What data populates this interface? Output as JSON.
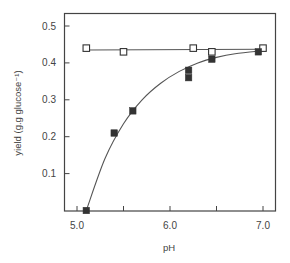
{
  "chart_data": {
    "type": "scatter",
    "title": "",
    "xlabel": "pH",
    "ylabel": "yield (g.g glucose⁻¹)",
    "xlim": [
      4.86,
      7.13
    ],
    "ylim": [
      0.0,
      0.535
    ],
    "x_ticks": [
      5.0,
      5.5,
      6.0,
      6.5,
      7.0
    ],
    "x_tick_labels": [
      "5.0",
      "",
      "6.0",
      "",
      "7.0"
    ],
    "y_ticks": [
      0.1,
      0.2,
      0.3,
      0.4,
      0.5
    ],
    "y_tick_labels": [
      "0.1",
      "0.2",
      "0.3",
      "0.4",
      "0.5"
    ],
    "grid": false,
    "legend": null,
    "series": [
      {
        "name": "open squares",
        "marker": "open-square",
        "fit": "straight line",
        "points": [
          {
            "x": 5.1,
            "y": 0.44
          },
          {
            "x": 5.5,
            "y": 0.43
          },
          {
            "x": 6.25,
            "y": 0.44
          },
          {
            "x": 6.45,
            "y": 0.43
          },
          {
            "x": 7.0,
            "y": 0.44
          }
        ],
        "fit_line": [
          {
            "x": 5.1,
            "y": 0.435
          },
          {
            "x": 7.0,
            "y": 0.437
          }
        ]
      },
      {
        "name": "filled squares",
        "marker": "filled-square",
        "fit": "saturating curve",
        "points": [
          {
            "x": 5.1,
            "y": 0.0
          },
          {
            "x": 5.4,
            "y": 0.21
          },
          {
            "x": 5.6,
            "y": 0.27
          },
          {
            "x": 6.2,
            "y": 0.38
          },
          {
            "x": 6.2,
            "y": 0.36
          },
          {
            "x": 6.45,
            "y": 0.41
          },
          {
            "x": 6.95,
            "y": 0.43
          }
        ],
        "fit_line": [
          {
            "x": 5.1,
            "y": 0.0
          },
          {
            "x": 5.3,
            "y": 0.14
          },
          {
            "x": 5.5,
            "y": 0.235
          },
          {
            "x": 5.7,
            "y": 0.3
          },
          {
            "x": 5.9,
            "y": 0.345
          },
          {
            "x": 6.1,
            "y": 0.377
          },
          {
            "x": 6.3,
            "y": 0.4
          },
          {
            "x": 6.5,
            "y": 0.415
          },
          {
            "x": 6.7,
            "y": 0.425
          },
          {
            "x": 7.0,
            "y": 0.433
          }
        ]
      }
    ]
  },
  "colors": {
    "axis": "#444444",
    "line": "#555555",
    "marker_fill": "#333333",
    "marker_open_fill": "#ffffff"
  }
}
